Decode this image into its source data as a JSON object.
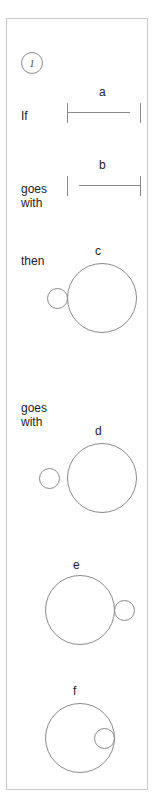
{
  "item": {
    "number": "1",
    "badge_name": "item-number-badge"
  },
  "relations": {
    "if": "If",
    "goes_with_1": "goes\nwith",
    "then": "then",
    "goes_with_2": "goes\nwith"
  },
  "figures": {
    "a": {
      "letter": "a",
      "type": "line-segment",
      "description": "left tick joined to horizontal bar, gap, detached right tick"
    },
    "b": {
      "letter": "b",
      "type": "line-segment",
      "description": "detached left tick, gap, horizontal bar joined to right tick"
    },
    "c": {
      "letter": "c",
      "type": "circles",
      "description": "large circle with small circle tangent on the outside left"
    },
    "d": {
      "letter": "d",
      "type": "circles",
      "description": "large circle with small circle separated to the left"
    },
    "e": {
      "letter": "e",
      "type": "circles",
      "description": "large circle with small circle tangent on the outside right"
    },
    "f": {
      "letter": "f",
      "type": "circles",
      "description": "large circle with small circle inside touching the right inner edge"
    }
  },
  "colors": {
    "stroke": "#8a8a8a",
    "panel_border": "#c9c9c9",
    "text": "#1d1d1d",
    "background": "#ffffff"
  }
}
